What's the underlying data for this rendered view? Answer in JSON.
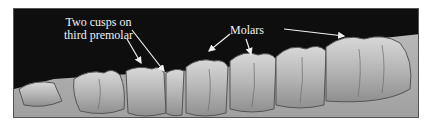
{
  "figure": {
    "annotations": [
      {
        "id": "cusps",
        "lines": [
          "Two cusps on",
          "third premolar"
        ]
      },
      {
        "id": "molars",
        "text": "Molars"
      }
    ],
    "colors": {
      "background": "#0e0e0e",
      "label_text": "#f2f2f2",
      "arrow": "#f0f0f0",
      "tooth": "#bdbdbd",
      "page": "#ffffff"
    }
  }
}
